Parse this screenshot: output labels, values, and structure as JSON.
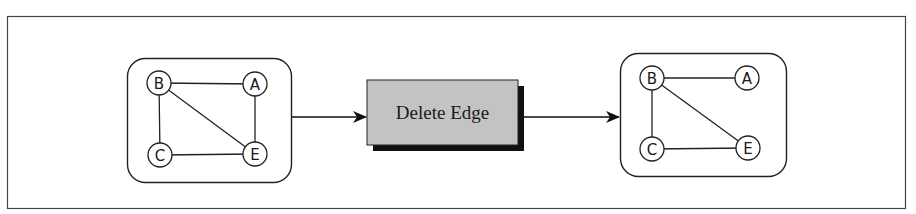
{
  "diagram": {
    "type": "graph-transformation",
    "operation": {
      "label": "Delete Edge",
      "fill": "#c3c3c3",
      "shadow": "#111111"
    },
    "before": {
      "nodes": [
        {
          "id": "B",
          "label": "B",
          "x": 159,
          "y": 83
        },
        {
          "id": "A",
          "label": "A",
          "x": 255,
          "y": 84
        },
        {
          "id": "C",
          "label": "C",
          "x": 160,
          "y": 155
        },
        {
          "id": "E",
          "label": "E",
          "x": 255,
          "y": 154
        }
      ],
      "edges": [
        [
          "B",
          "A"
        ],
        [
          "B",
          "C"
        ],
        [
          "B",
          "E"
        ],
        [
          "A",
          "E"
        ],
        [
          "C",
          "E"
        ]
      ]
    },
    "after": {
      "nodes": [
        {
          "id": "B",
          "label": "B",
          "x": 652,
          "y": 78
        },
        {
          "id": "A",
          "label": "A",
          "x": 747,
          "y": 78
        },
        {
          "id": "C",
          "label": "C",
          "x": 652,
          "y": 149
        },
        {
          "id": "E",
          "label": "E",
          "x": 748,
          "y": 148
        }
      ],
      "edges": [
        [
          "B",
          "A"
        ],
        [
          "B",
          "C"
        ],
        [
          "B",
          "E"
        ],
        [
          "C",
          "E"
        ]
      ]
    }
  }
}
